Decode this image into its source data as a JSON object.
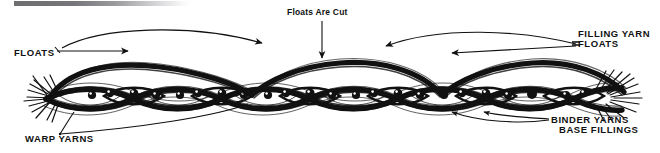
{
  "figure": {
    "kind": "textile-weave-cross-section",
    "background_color": "#ffffff",
    "ink_color": "#111111",
    "scan_artifact": {
      "name": "scan-edge-bar",
      "color_start": "#6e6e70",
      "color_end": "#ffffff"
    }
  },
  "labels": {
    "floats_left": "FLOATS",
    "floats_are_cut": "Floats Are Cut",
    "filling_yarn": "FILLING YARN",
    "filling_floats": "FLOATS",
    "warp_yarns": "WARP YARNS",
    "binder_yarns": "BINDER YARNS",
    "base_fillings": "BASE FILLINGS"
  },
  "annotations": {
    "leaders": [
      {
        "name": "floats-left-leader",
        "from": "FLOATS",
        "points_to": "upper float arcs"
      },
      {
        "name": "floats-cut-arrow",
        "from": "Floats Are Cut",
        "points_to": "center float crest",
        "direction": "down"
      },
      {
        "name": "filling-yarn-floats-leader",
        "from": "FILLING YARN FLOATS",
        "points_to": "upper right float arcs",
        "direction": "left"
      },
      {
        "name": "warp-yarns-leader",
        "from": "WARP YARNS",
        "points_to": "warp yarn ends",
        "direction": "up-right"
      },
      {
        "name": "binder-yarns-leader",
        "from": "BINDER YARNS",
        "points_to": "binder yarn crossings",
        "direction": "up-left"
      },
      {
        "name": "base-fillings-leader",
        "from": "BASE FILLINGS",
        "points_to": "base filling yarns",
        "direction": "up-left"
      }
    ]
  },
  "structure": {
    "weave_band": {
      "name": "warp-filling-interlacing",
      "description": "Interlacing warp yarns drawn as heavy wavy strands forming lens-shaped openings",
      "lens_count": 11,
      "dots_per_lens": 2,
      "dot_meaning": "filling yarn cross-section"
    },
    "float_arcs": {
      "name": "filling-yarn-floats",
      "count": 3,
      "description": "Heavy arcs riding above the weave plane, cut at the center"
    },
    "frayed_ends": {
      "left": true,
      "right": true,
      "description": "Splayed fiber ends at both edges of the fabric section"
    }
  }
}
